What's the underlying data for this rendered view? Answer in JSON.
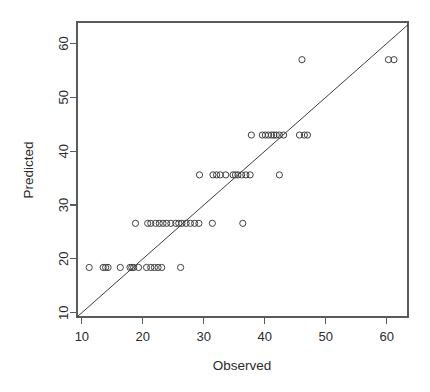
{
  "chart_data": {
    "type": "scatter",
    "title": "",
    "subtitle": "",
    "xlabel": "Observed",
    "ylabel": "Predicted",
    "xlim": [
      9.2,
      63.5
    ],
    "ylim": [
      9.2,
      64.0
    ],
    "xticks": [
      10,
      20,
      30,
      40,
      50,
      60
    ],
    "yticks": [
      10,
      20,
      30,
      40,
      50,
      60
    ],
    "xtick_labels": [
      "10",
      "20",
      "30",
      "40",
      "50",
      "60"
    ],
    "ytick_labels": [
      "10",
      "20",
      "30",
      "40",
      "50",
      "60"
    ],
    "grid": false,
    "legend": null,
    "point_marker": "open-circle",
    "point_color": "#404040",
    "reference_line": {
      "name": "identity-line",
      "description": "y = x diagonal reference line",
      "from": [
        9.2,
        9.2
      ],
      "to": [
        63.5,
        63.5
      ],
      "color": "#3d3d3d"
    },
    "series": [
      {
        "name": "Observed vs Predicted",
        "points": [
          [
            11.2,
            18.4
          ],
          [
            13.5,
            18.4
          ],
          [
            13.9,
            18.4
          ],
          [
            14.3,
            18.4
          ],
          [
            16.3,
            18.4
          ],
          [
            17.9,
            18.4
          ],
          [
            18.2,
            18.4
          ],
          [
            18.5,
            18.4
          ],
          [
            19.3,
            18.4
          ],
          [
            20.6,
            18.4
          ],
          [
            21.3,
            18.4
          ],
          [
            21.9,
            18.4
          ],
          [
            22.5,
            18.4
          ],
          [
            23.1,
            18.4
          ],
          [
            26.2,
            18.4
          ],
          [
            18.8,
            26.6
          ],
          [
            20.8,
            26.6
          ],
          [
            21.3,
            26.6
          ],
          [
            22.1,
            26.6
          ],
          [
            22.7,
            26.6
          ],
          [
            23.3,
            26.6
          ],
          [
            23.9,
            26.6
          ],
          [
            24.6,
            26.6
          ],
          [
            25.4,
            26.6
          ],
          [
            25.9,
            26.6
          ],
          [
            26.4,
            26.6
          ],
          [
            27.1,
            26.6
          ],
          [
            27.8,
            26.6
          ],
          [
            28.5,
            26.6
          ],
          [
            29.2,
            26.6
          ],
          [
            31.4,
            26.6
          ],
          [
            36.4,
            26.6
          ],
          [
            29.3,
            35.6
          ],
          [
            31.5,
            35.6
          ],
          [
            32.1,
            35.6
          ],
          [
            32.7,
            35.6
          ],
          [
            33.6,
            35.6
          ],
          [
            34.8,
            35.6
          ],
          [
            35.2,
            35.6
          ],
          [
            35.6,
            35.6
          ],
          [
            36.2,
            35.6
          ],
          [
            36.9,
            35.6
          ],
          [
            37.6,
            35.6
          ],
          [
            42.4,
            35.6
          ],
          [
            37.8,
            43.0
          ],
          [
            39.6,
            43.0
          ],
          [
            40.1,
            43.0
          ],
          [
            40.6,
            43.0
          ],
          [
            41.1,
            43.0
          ],
          [
            41.5,
            43.0
          ],
          [
            41.9,
            43.0
          ],
          [
            42.4,
            43.0
          ],
          [
            43.1,
            43.0
          ],
          [
            45.7,
            43.0
          ],
          [
            46.5,
            43.0
          ],
          [
            47.0,
            43.0
          ],
          [
            46.1,
            57.0
          ],
          [
            60.3,
            57.0
          ],
          [
            61.2,
            57.0
          ]
        ]
      }
    ]
  },
  "axes": {
    "x_title": "Observed",
    "y_title": "Predicted"
  }
}
